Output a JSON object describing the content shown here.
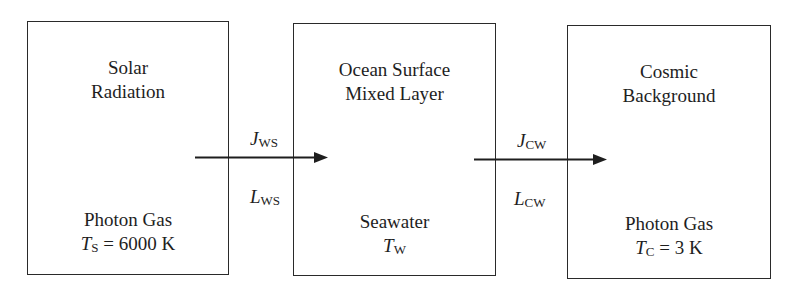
{
  "diagram": {
    "boxes": [
      {
        "id": "solar",
        "title_line1": "Solar",
        "title_line2": "Radiation",
        "substance": "Photon Gas",
        "temp_symbol": "T",
        "temp_subscript": "S",
        "temp_value": " = 6000 K"
      },
      {
        "id": "ocean",
        "title_line1": "Ocean Surface",
        "title_line2": "Mixed Layer",
        "substance": "Seawater",
        "temp_symbol": "T",
        "temp_subscript": "W",
        "temp_value": ""
      },
      {
        "id": "cosmic",
        "title_line1": "Cosmic",
        "title_line2": "Background",
        "substance": "Photon Gas",
        "temp_symbol": "T",
        "temp_subscript": "C",
        "temp_value": " = 3 K"
      }
    ],
    "flows": [
      {
        "energy_symbol": "J",
        "energy_subscript": "WS",
        "entropy_symbol": "L",
        "entropy_subscript": "WS"
      },
      {
        "energy_symbol": "J",
        "energy_subscript": "CW",
        "entropy_symbol": "L",
        "entropy_subscript": "CW"
      }
    ]
  }
}
